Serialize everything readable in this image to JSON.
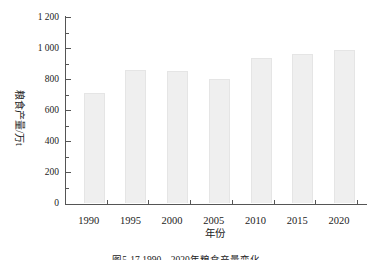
{
  "figure": {
    "caption": "图5-17  1990—2020年粮食产量变化"
  },
  "chart_data": {
    "type": "bar",
    "title": "",
    "xlabel": "年份",
    "ylabel": "粮食产量/万t",
    "categories": [
      "1990",
      "1995",
      "2000",
      "2005",
      "2010",
      "2015",
      "2020"
    ],
    "values": [
      710,
      860,
      850,
      800,
      935,
      965,
      985
    ],
    "ylim": [
      0,
      1200
    ],
    "ytick_step": 200,
    "minor_ytick_step": 100,
    "ytick_labels": [
      "0",
      "200",
      "400",
      "600",
      "800",
      "1 000",
      "1 200"
    ],
    "grid": false,
    "legend": "none",
    "bar_color": "#efefef",
    "bar_border_color": "#e5e5e5",
    "axis_color": "#555555",
    "text_color": "#222222"
  }
}
